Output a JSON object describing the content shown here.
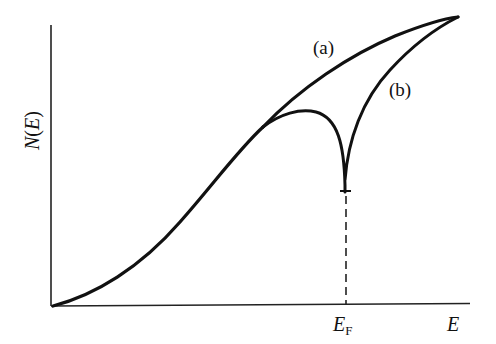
{
  "diagram": {
    "axes": {
      "y_label_main": "N",
      "y_label_open": "(",
      "y_label_var": "E",
      "y_label_close": ")",
      "x_label": "E",
      "x_marker_main": "E",
      "x_marker_sub": "F"
    },
    "curves": [
      {
        "id": "a",
        "label": "(a)",
        "description": "smooth monotonically increasing density of states"
      },
      {
        "id": "b",
        "label": "(b)",
        "description": "density of states with a sharp cusp/dip down to a minimum at E_F"
      }
    ],
    "markers": {
      "fermi_level_line": "dashed vertical line from axis up to minimum of curve (b)"
    },
    "colors": {
      "line": "#111111",
      "background": "#ffffff"
    }
  }
}
